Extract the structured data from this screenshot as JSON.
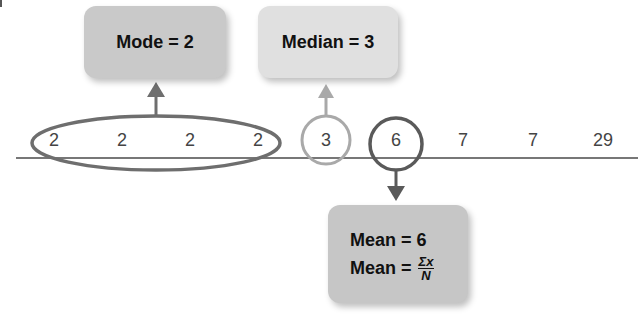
{
  "numbers": [
    "2",
    "2",
    "2",
    "2",
    "3",
    "6",
    "7",
    "7",
    "29"
  ],
  "mode_label": "Mode = 2",
  "median_label": "Median = 3",
  "mean": {
    "line1": "Mean = 6",
    "line2_prefix": "Mean =",
    "numerator": "Σx",
    "denominator": "N"
  },
  "colors": {
    "mode": "#6e6e6e",
    "median": "#a9a9a9",
    "mean": "#5a5a5a",
    "axis": "#777777"
  }
}
